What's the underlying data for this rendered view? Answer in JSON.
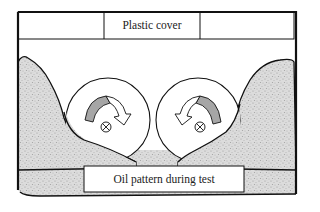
{
  "diagram": {
    "labels": {
      "plastic_cover": "Plastic cover",
      "oil_pattern": "Oil pattern during test"
    },
    "components": {
      "frame": "outer-frame",
      "cover": "plastic-cover-strip",
      "wheels": [
        {
          "name": "left-wheel",
          "rotation": "clockwise",
          "center_symbol": "cross-in-circle"
        },
        {
          "name": "right-wheel",
          "rotation": "counter-clockwise",
          "center_symbol": "cross-in-circle"
        }
      ],
      "oil_regions": [
        "left-oil-region",
        "right-oil-region",
        "bottom-oil-region"
      ]
    },
    "colors": {
      "line": "#111111",
      "oil_fill": "#d9d9d9",
      "oil_speckle": "#a8a8a8",
      "arrow_fill": "#a6a6a6",
      "background": "#ffffff"
    }
  }
}
